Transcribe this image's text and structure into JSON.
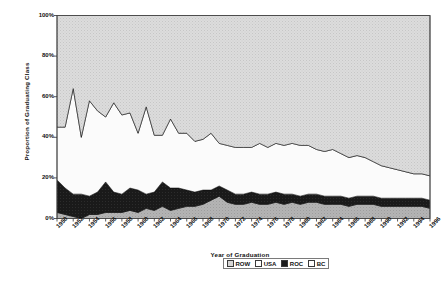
{
  "chart_data": {
    "type": "area",
    "stacked": true,
    "title": "",
    "xlabel": "Year of Graduation",
    "ylabel": "Proportion of Graduating Class",
    "xlim": [
      1950,
      1996
    ],
    "ylim": [
      0,
      100
    ],
    "ytick_labels": [
      "0%",
      "20%",
      "40%",
      "60%",
      "80%",
      "100%"
    ],
    "ytick_values": [
      0,
      20,
      40,
      60,
      80,
      100
    ],
    "grid": false,
    "legend_position": "bottom-right",
    "legend": [
      "ROW",
      "USA",
      "ROC",
      "BC"
    ],
    "x": [
      1950,
      1951,
      1952,
      1953,
      1954,
      1955,
      1956,
      1957,
      1958,
      1959,
      1960,
      1961,
      1962,
      1963,
      1964,
      1965,
      1966,
      1967,
      1968,
      1969,
      1970,
      1971,
      1972,
      1973,
      1974,
      1975,
      1976,
      1977,
      1978,
      1979,
      1980,
      1981,
      1982,
      1983,
      1984,
      1985,
      1986,
      1987,
      1988,
      1989,
      1990,
      1991,
      1992,
      1993,
      1994,
      1995,
      1996
    ],
    "xtick_labels": [
      "1950",
      "1952",
      "1954",
      "1956",
      "1958",
      "1960",
      "1962",
      "1964",
      "1966",
      "1968",
      "1970",
      "1972",
      "1974",
      "1976",
      "1978",
      "1980",
      "1982",
      "1984",
      "1986",
      "1988",
      "1990",
      "1992",
      "1994",
      "1996"
    ],
    "series": [
      {
        "name": "BC",
        "color": "#ffffff",
        "values": [
          3,
          2,
          1,
          0,
          2,
          2,
          3,
          3,
          3,
          4,
          3,
          5,
          4,
          6,
          4,
          5,
          6,
          6,
          7,
          9,
          11,
          8,
          7,
          7,
          8,
          7,
          7,
          8,
          7,
          8,
          7,
          8,
          8,
          7,
          7,
          7,
          6,
          7,
          7,
          7,
          6,
          6,
          6,
          6,
          6,
          6,
          5
        ]
      },
      {
        "name": "ROC",
        "color": "#1c1c1c",
        "values": [
          16,
          13,
          11,
          12,
          9,
          11,
          15,
          10,
          9,
          11,
          11,
          7,
          9,
          12,
          11,
          10,
          8,
          7,
          7,
          5,
          5,
          6,
          5,
          5,
          5,
          5,
          5,
          5,
          5,
          4,
          4,
          4,
          4,
          4,
          4,
          4,
          4,
          4,
          4,
          4,
          4,
          4,
          4,
          4,
          4,
          4,
          4
        ]
      },
      {
        "name": "USA",
        "color": "#fdfdfd",
        "values": [
          26,
          30,
          52,
          28,
          47,
          40,
          32,
          44,
          39,
          37,
          28,
          43,
          28,
          23,
          34,
          27,
          28,
          25,
          25,
          28,
          21,
          22,
          23,
          23,
          22,
          25,
          23,
          24,
          24,
          25,
          25,
          24,
          22,
          22,
          23,
          21,
          20,
          20,
          19,
          17,
          16,
          15,
          14,
          13,
          12,
          12,
          12
        ]
      },
      {
        "name": "ROW",
        "color": "#d6d6d6",
        "values": [
          55,
          55,
          36,
          60,
          42,
          47,
          50,
          43,
          49,
          48,
          58,
          45,
          59,
          59,
          51,
          58,
          58,
          62,
          61,
          58,
          63,
          64,
          65,
          65,
          65,
          63,
          65,
          63,
          64,
          63,
          64,
          64,
          66,
          67,
          66,
          68,
          70,
          69,
          70,
          72,
          74,
          75,
          76,
          77,
          78,
          78,
          79
        ]
      }
    ]
  },
  "axes": {
    "ylabel": "Proportion of Graduating Class",
    "xlabel": "Year of Graduation"
  },
  "legend": {
    "items": [
      {
        "label": "ROW",
        "swatch": "sw-row"
      },
      {
        "label": "USA",
        "swatch": "sw-usa"
      },
      {
        "label": "ROC",
        "swatch": "sw-roc"
      },
      {
        "label": "BC",
        "swatch": "sw-bc"
      }
    ]
  }
}
